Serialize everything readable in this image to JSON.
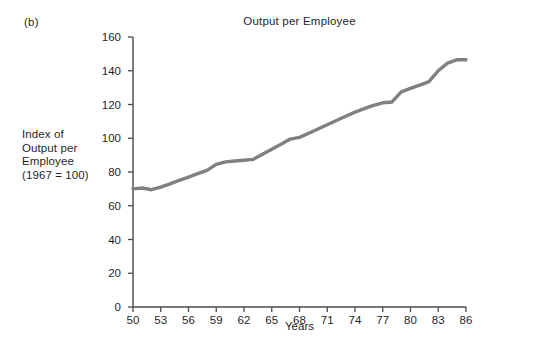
{
  "figure": {
    "panel_label": "(b)",
    "title": "Output per Employee",
    "y_axis_title_lines": [
      "Index of",
      "Output per",
      "Employee",
      "(1967 = 100)"
    ],
    "x_axis_title": "Years"
  },
  "chart_data": {
    "type": "line",
    "title": "Output per Employee",
    "xlabel": "Years",
    "ylabel": "Index of Output per Employee (1967 = 100)",
    "xlim": [
      50,
      86
    ],
    "ylim": [
      0,
      160
    ],
    "grid": false,
    "legend": false,
    "line_color": "#808080",
    "line_width": 3.4,
    "x_ticks": [
      50,
      53,
      56,
      59,
      62,
      65,
      68,
      71,
      74,
      77,
      80,
      83,
      86
    ],
    "y_ticks": [
      0,
      20,
      40,
      60,
      80,
      100,
      120,
      140,
      160
    ],
    "x": [
      50,
      51,
      52,
      53,
      54,
      55,
      56,
      57,
      58,
      59,
      60,
      61,
      62,
      63,
      64,
      65,
      66,
      67,
      68,
      69,
      70,
      71,
      72,
      73,
      74,
      75,
      76,
      77,
      78,
      79,
      80,
      81,
      82,
      83,
      84,
      85,
      86
    ],
    "values": [
      70,
      70.5,
      69.5,
      71,
      73,
      75,
      77,
      79,
      81,
      84.5,
      86,
      86.5,
      87,
      87.5,
      90.5,
      93.5,
      96.5,
      99.5,
      100.5,
      103,
      105.5,
      108,
      110.5,
      113,
      115.5,
      117.5,
      119.5,
      121,
      121.5,
      127.5,
      129.5,
      131.5,
      133.5,
      140,
      144.5,
      146.5,
      146.5
    ],
    "series": [
      {
        "name": "Output per Employee",
        "values": [
          70,
          70.5,
          69.5,
          71,
          73,
          75,
          77,
          79,
          81,
          84.5,
          86,
          86.5,
          87,
          87.5,
          90.5,
          93.5,
          96.5,
          99.5,
          100.5,
          103,
          105.5,
          108,
          110.5,
          113,
          115.5,
          117.5,
          119.5,
          121,
          121.5,
          127.5,
          129.5,
          131.5,
          133.5,
          140,
          144.5,
          146.5,
          146.5
        ]
      }
    ]
  },
  "style": {
    "axis_color": "#4a4a4a",
    "text_color": "#1f1f1f",
    "background": "#ffffff"
  }
}
